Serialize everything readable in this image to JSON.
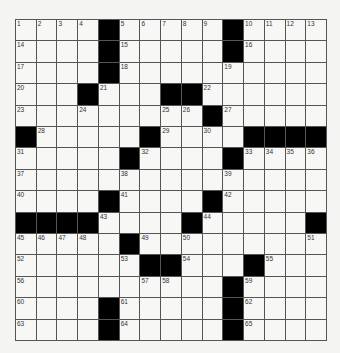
{
  "puzzle": {
    "rows": 15,
    "cols": 15,
    "colors": {
      "black": "#000000",
      "white": "#f7f7f6",
      "line": "#555555"
    },
    "grid": [
      [
        "1",
        "2",
        "3",
        "4",
        "#",
        "5",
        "6",
        "7",
        "8",
        "9",
        "#",
        "10",
        "11",
        "12",
        "13"
      ],
      [
        "14",
        "",
        "",
        "",
        "#",
        "15",
        "",
        "",
        "",
        "",
        "#",
        "16",
        "",
        "",
        ""
      ],
      [
        "17",
        "",
        "",
        "",
        "#",
        "18",
        "",
        "",
        "",
        "",
        "19",
        "",
        "",
        "",
        ""
      ],
      [
        "20",
        "",
        "",
        "#",
        "21",
        "",
        "",
        "#",
        "#",
        "22",
        "",
        "",
        "",
        "",
        ""
      ],
      [
        "23",
        "",
        "",
        "24",
        "",
        "",
        "",
        "25",
        "26",
        "#",
        "27",
        "",
        "",
        "",
        ""
      ],
      [
        "#",
        "28",
        "",
        "",
        "",
        "",
        "#",
        "29",
        "",
        "30",
        "",
        "#",
        "#",
        "#",
        "#"
      ],
      [
        "31",
        "",
        "",
        "",
        "",
        "#",
        "32",
        "",
        "",
        "",
        "#",
        "33",
        "34",
        "35",
        "36"
      ],
      [
        "37",
        "",
        "",
        "",
        "",
        "38",
        "",
        "",
        "",
        "",
        "39",
        "",
        "",
        "",
        ""
      ],
      [
        "40",
        "",
        "",
        "",
        "#",
        "41",
        "",
        "",
        "",
        "#",
        "42",
        "",
        "",
        "",
        ""
      ],
      [
        "#",
        "#",
        "#",
        "#",
        "43",
        "",
        "",
        "",
        "#",
        "44",
        "",
        "",
        "",
        "",
        "#"
      ],
      [
        "45",
        "46",
        "47",
        "48",
        "",
        "#",
        "49",
        "",
        "50",
        "",
        "",
        "",
        "",
        "",
        "51"
      ],
      [
        "52",
        "",
        "",
        "",
        "",
        "53",
        "#",
        "#",
        "54",
        "",
        "",
        "#",
        "55",
        "",
        ""
      ],
      [
        "56",
        "",
        "",
        "",
        "",
        "",
        "57",
        "58",
        "",
        "",
        "#",
        "59",
        "",
        "",
        ""
      ],
      [
        "60",
        "",
        "",
        "",
        "#",
        "61",
        "",
        "",
        "",
        "",
        "#",
        "62",
        "",
        "",
        ""
      ],
      [
        "63",
        "",
        "",
        "",
        "#",
        "64",
        "",
        "",
        "",
        "",
        "#",
        "65",
        "",
        "",
        ""
      ]
    ]
  }
}
